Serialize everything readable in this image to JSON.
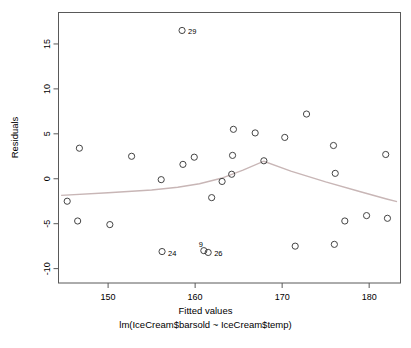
{
  "chart_data": {
    "type": "scatter",
    "title": "",
    "xlabel": "Fitted values",
    "sublabel": "lm(IceCream$barsold ~ IceCream$temp)",
    "ylabel": "Residuals",
    "xlim": [
      144.3,
      183.6
    ],
    "ylim": [
      -11.6,
      18.5
    ],
    "xticks": [
      150,
      160,
      170,
      180
    ],
    "yticks": [
      -10,
      -5,
      0,
      5,
      10,
      15
    ],
    "grid": false,
    "legend": null,
    "point_color": "#444444",
    "smoother_color": "#c8b6b6",
    "box_color": "#595959",
    "points": [
      {
        "x": 145.3,
        "y": -2.5,
        "label": ""
      },
      {
        "x": 146.5,
        "y": -4.7,
        "label": ""
      },
      {
        "x": 146.7,
        "y": 3.4,
        "label": ""
      },
      {
        "x": 150.2,
        "y": -5.1,
        "label": ""
      },
      {
        "x": 152.7,
        "y": 2.5,
        "label": ""
      },
      {
        "x": 156.1,
        "y": -0.1,
        "label": ""
      },
      {
        "x": 156.2,
        "y": -8.1,
        "label": "24"
      },
      {
        "x": 158.5,
        "y": 16.5,
        "label": "29"
      },
      {
        "x": 158.6,
        "y": 1.6,
        "label": ""
      },
      {
        "x": 159.9,
        "y": 2.4,
        "label": ""
      },
      {
        "x": 161.0,
        "y": -8.0,
        "label": "9"
      },
      {
        "x": 161.5,
        "y": -8.2,
        "label": "26"
      },
      {
        "x": 161.9,
        "y": -2.1,
        "label": ""
      },
      {
        "x": 163.1,
        "y": -0.3,
        "label": ""
      },
      {
        "x": 164.2,
        "y": 0.5,
        "label": ""
      },
      {
        "x": 164.3,
        "y": 2.6,
        "label": ""
      },
      {
        "x": 164.4,
        "y": 5.5,
        "label": ""
      },
      {
        "x": 166.9,
        "y": 5.1,
        "label": ""
      },
      {
        "x": 167.9,
        "y": 2.0,
        "label": ""
      },
      {
        "x": 170.3,
        "y": 4.6,
        "label": ""
      },
      {
        "x": 171.5,
        "y": -7.5,
        "label": ""
      },
      {
        "x": 172.8,
        "y": 7.2,
        "label": ""
      },
      {
        "x": 175.9,
        "y": 3.7,
        "label": ""
      },
      {
        "x": 176.0,
        "y": -7.3,
        "label": ""
      },
      {
        "x": 176.1,
        "y": 0.6,
        "label": ""
      },
      {
        "x": 177.2,
        "y": -4.7,
        "label": ""
      },
      {
        "x": 179.7,
        "y": -4.1,
        "label": ""
      },
      {
        "x": 181.9,
        "y": 2.7,
        "label": ""
      },
      {
        "x": 182.1,
        "y": -4.4,
        "label": ""
      }
    ],
    "smoother": [
      {
        "x": 144.6,
        "y": -1.85
      },
      {
        "x": 150.0,
        "y": -1.55
      },
      {
        "x": 155.0,
        "y": -1.25
      },
      {
        "x": 158.0,
        "y": -0.95
      },
      {
        "x": 160.5,
        "y": -0.55
      },
      {
        "x": 163.0,
        "y": 0.05
      },
      {
        "x": 165.5,
        "y": 0.95
      },
      {
        "x": 167.9,
        "y": 1.95
      },
      {
        "x": 171.0,
        "y": 0.85
      },
      {
        "x": 175.0,
        "y": -0.35
      },
      {
        "x": 179.0,
        "y": -1.45
      },
      {
        "x": 182.0,
        "y": -2.25
      },
      {
        "x": 183.2,
        "y": -2.55
      }
    ]
  }
}
